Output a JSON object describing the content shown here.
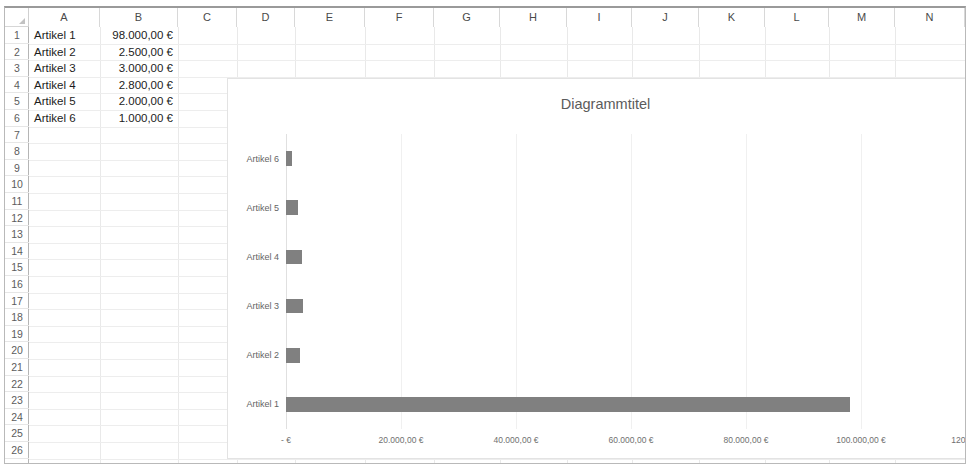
{
  "app": {
    "type": "spreadsheet",
    "columns": [
      "A",
      "B",
      "C",
      "D",
      "E",
      "F",
      "G",
      "H",
      "I",
      "J",
      "K",
      "L",
      "M",
      "N"
    ],
    "rows": [
      1,
      2,
      3,
      4,
      5,
      6,
      7,
      8,
      9,
      10,
      11,
      12,
      13,
      14,
      15,
      16,
      17,
      18,
      19,
      20,
      21,
      22,
      23,
      24,
      25,
      26,
      27
    ],
    "select_all_icon": "select-all-triangle"
  },
  "cells": {
    "column_a": [
      {
        "row": 1,
        "text": "Artikel 1"
      },
      {
        "row": 2,
        "text": "Artikel 2"
      },
      {
        "row": 3,
        "text": "Artikel 3"
      },
      {
        "row": 4,
        "text": "Artikel 4"
      },
      {
        "row": 5,
        "text": "Artikel 5"
      },
      {
        "row": 6,
        "text": "Artikel 6"
      }
    ],
    "column_b": [
      {
        "row": 1,
        "text": "98.000,00 €"
      },
      {
        "row": 2,
        "text": "2.500,00 €"
      },
      {
        "row": 3,
        "text": "3.000,00 €"
      },
      {
        "row": 4,
        "text": "2.800,00 €"
      },
      {
        "row": 5,
        "text": "2.000,00 €"
      },
      {
        "row": 6,
        "text": "1.000,00 €"
      }
    ]
  },
  "chart_data": {
    "type": "bar",
    "orientation": "horizontal",
    "title": "Diagrammtitel",
    "xlabel": "",
    "ylabel": "",
    "categories": [
      "Artikel 1",
      "Artikel 2",
      "Artikel 3",
      "Artikel 4",
      "Artikel 5",
      "Artikel 6"
    ],
    "values": [
      98000,
      2500,
      3000,
      2800,
      2000,
      1000
    ],
    "value_labels": [
      "98.000,00 €",
      "2.500,00 €",
      "3.000,00 €",
      "2.800,00 €",
      "2.000,00 €",
      "1.000,00 €"
    ],
    "display_order": [
      "Artikel 6",
      "Artikel 5",
      "Artikel 4",
      "Artikel 3",
      "Artikel 2",
      "Artikel 1"
    ],
    "xlim": [
      0,
      120000
    ],
    "xticks": [
      0,
      20000,
      40000,
      60000,
      80000,
      100000,
      120000
    ],
    "xtick_labels": [
      "-   €",
      "20.000,00 €",
      "40.000,00 €",
      "60.000,00 €",
      "80.000,00 €",
      "100.000,00 €",
      "120.000,00 €"
    ],
    "grid": true,
    "grid_axis": "x",
    "legend": false,
    "series_color": "#808080"
  }
}
